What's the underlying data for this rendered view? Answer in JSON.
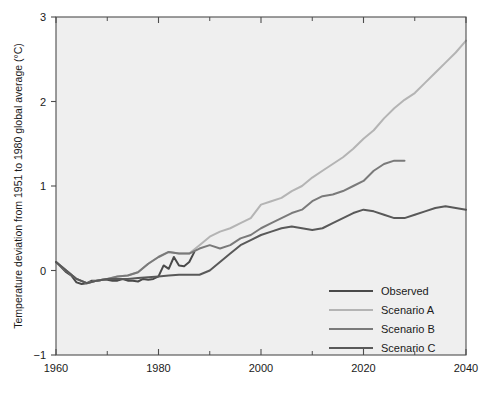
{
  "chart_data": {
    "type": "line",
    "title": "",
    "xlabel": "",
    "ylabel": "Temperature deviation from 1951 to 1980 global average (°C)",
    "xlim": [
      1960,
      2040
    ],
    "ylim": [
      -1,
      3
    ],
    "xticks": [
      1960,
      1980,
      2000,
      2020,
      2040
    ],
    "xtick_labels": [
      "1960",
      "1980",
      "2000",
      "2020",
      "2040"
    ],
    "xticks_minor": [
      1970,
      1990,
      2010,
      2030
    ],
    "yticks": [
      -1,
      0,
      1,
      2,
      3
    ],
    "ytick_labels": [
      "−1",
      "0",
      "1",
      "2",
      "3"
    ],
    "grid": false,
    "legend_position": "lower-right",
    "plot_background": "#efefef",
    "series": [
      {
        "name": "Observed",
        "color": "#4a4a4a",
        "width": 2.0,
        "x": [
          1960,
          1961,
          1962,
          1963,
          1964,
          1965,
          1966,
          1967,
          1968,
          1969,
          1970,
          1971,
          1972,
          1973,
          1974,
          1975,
          1976,
          1977,
          1978,
          1979,
          1980,
          1981,
          1982,
          1983,
          1984,
          1985,
          1986,
          1987
        ],
        "y": [
          0.1,
          0.04,
          -0.02,
          -0.06,
          -0.14,
          -0.16,
          -0.15,
          -0.12,
          -0.12,
          -0.11,
          -0.11,
          -0.12,
          -0.12,
          -0.1,
          -0.12,
          -0.12,
          -0.13,
          -0.1,
          -0.11,
          -0.1,
          -0.07,
          0.06,
          0.02,
          0.16,
          0.06,
          0.05,
          0.1,
          0.22
        ]
      },
      {
        "name": "Scenario A",
        "color": "#b4b4b4",
        "width": 2.0,
        "x": [
          1960,
          1962,
          1964,
          1966,
          1968,
          1970,
          1972,
          1974,
          1976,
          1978,
          1980,
          1982,
          1984,
          1986,
          1988,
          1990,
          1992,
          1994,
          1996,
          1998,
          2000,
          2002,
          2004,
          2006,
          2008,
          2010,
          2012,
          2014,
          2016,
          2018,
          2020,
          2022,
          2024,
          2026,
          2028,
          2030,
          2032,
          2034,
          2036,
          2038,
          2040
        ],
        "y": [
          0.1,
          0.0,
          -0.1,
          -0.15,
          -0.12,
          -0.1,
          -0.07,
          -0.06,
          -0.02,
          0.08,
          0.16,
          0.22,
          0.2,
          0.2,
          0.3,
          0.4,
          0.46,
          0.5,
          0.56,
          0.62,
          0.78,
          0.82,
          0.86,
          0.94,
          1.0,
          1.1,
          1.18,
          1.26,
          1.34,
          1.44,
          1.56,
          1.66,
          1.8,
          1.92,
          2.02,
          2.1,
          2.22,
          2.34,
          2.46,
          2.58,
          2.72
        ]
      },
      {
        "name": "Scenario B",
        "color": "#7a7a7a",
        "width": 2.0,
        "x": [
          1960,
          1962,
          1964,
          1966,
          1968,
          1970,
          1972,
          1974,
          1976,
          1978,
          1980,
          1982,
          1984,
          1986,
          1988,
          1990,
          1992,
          1994,
          1996,
          1998,
          2000,
          2002,
          2004,
          2006,
          2008,
          2010,
          2012,
          2014,
          2016,
          2018,
          2020,
          2022,
          2024,
          2026,
          2028
        ],
        "y": [
          0.1,
          0.0,
          -0.1,
          -0.15,
          -0.12,
          -0.1,
          -0.07,
          -0.06,
          -0.02,
          0.08,
          0.16,
          0.22,
          0.2,
          0.2,
          0.26,
          0.3,
          0.26,
          0.3,
          0.38,
          0.42,
          0.5,
          0.56,
          0.62,
          0.68,
          0.72,
          0.82,
          0.88,
          0.9,
          0.94,
          1.0,
          1.06,
          1.18,
          1.26,
          1.3,
          1.3
        ]
      },
      {
        "name": "Scenario C",
        "color": "#595959",
        "width": 2.0,
        "x": [
          1960,
          1962,
          1964,
          1966,
          1968,
          1970,
          1972,
          1974,
          1976,
          1978,
          1980,
          1982,
          1984,
          1986,
          1988,
          1990,
          1992,
          1994,
          1996,
          1998,
          2000,
          2002,
          2004,
          2006,
          2008,
          2010,
          2012,
          2014,
          2016,
          2018,
          2020,
          2022,
          2024,
          2026,
          2028,
          2030,
          2032,
          2034,
          2036,
          2038,
          2040
        ],
        "y": [
          0.1,
          0.0,
          -0.1,
          -0.15,
          -0.12,
          -0.1,
          -0.1,
          -0.1,
          -0.09,
          -0.08,
          -0.07,
          -0.06,
          -0.05,
          -0.05,
          -0.05,
          0.0,
          0.1,
          0.2,
          0.3,
          0.36,
          0.42,
          0.46,
          0.5,
          0.52,
          0.5,
          0.48,
          0.5,
          0.56,
          0.62,
          0.68,
          0.72,
          0.7,
          0.66,
          0.62,
          0.62,
          0.66,
          0.7,
          0.74,
          0.76,
          0.74,
          0.72
        ]
      }
    ],
    "legend": [
      {
        "label": "Observed",
        "color": "#4a4a4a"
      },
      {
        "label": "Scenario A",
        "color": "#b4b4b4"
      },
      {
        "label": "Scenario B",
        "color": "#7a7a7a"
      },
      {
        "label": "Scenario C",
        "color": "#595959"
      }
    ]
  }
}
